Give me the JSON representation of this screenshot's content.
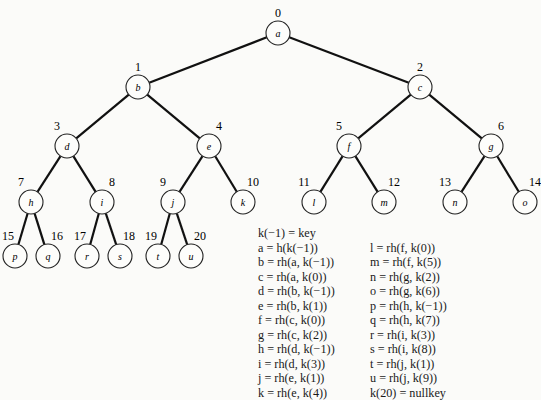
{
  "diagram": {
    "type": "binary-tree",
    "nodes": [
      {
        "id": "a",
        "index": "0",
        "x": 278,
        "y": 33
      },
      {
        "id": "b",
        "index": "1",
        "x": 138,
        "y": 87
      },
      {
        "id": "c",
        "index": "2",
        "x": 420,
        "y": 87
      },
      {
        "id": "d",
        "index": "3",
        "x": 67,
        "y": 146
      },
      {
        "id": "e",
        "index": "4",
        "x": 209,
        "y": 146
      },
      {
        "id": "f",
        "index": "5",
        "x": 349,
        "y": 146
      },
      {
        "id": "g",
        "index": "6",
        "x": 491,
        "y": 146
      },
      {
        "id": "h",
        "index": "7",
        "x": 31,
        "y": 202
      },
      {
        "id": "i",
        "index": "8",
        "x": 102,
        "y": 202
      },
      {
        "id": "j",
        "index": "9",
        "x": 173,
        "y": 202
      },
      {
        "id": "k",
        "index": "10",
        "x": 243,
        "y": 202
      },
      {
        "id": "l",
        "index": "11",
        "x": 314,
        "y": 202
      },
      {
        "id": "m",
        "index": "12",
        "x": 384,
        "y": 202
      },
      {
        "id": "n",
        "index": "13",
        "x": 455,
        "y": 202
      },
      {
        "id": "o",
        "index": "14",
        "x": 525,
        "y": 202
      },
      {
        "id": "p",
        "index": "15",
        "x": 15,
        "y": 256
      },
      {
        "id": "q",
        "index": "16",
        "x": 48,
        "y": 256
      },
      {
        "id": "r",
        "index": "17",
        "x": 87,
        "y": 256
      },
      {
        "id": "s",
        "index": "18",
        "x": 120,
        "y": 256
      },
      {
        "id": "t",
        "index": "19",
        "x": 158,
        "y": 256
      },
      {
        "id": "u",
        "index": "20",
        "x": 191,
        "y": 256
      }
    ],
    "edges": [
      [
        "a",
        "b"
      ],
      [
        "a",
        "c"
      ],
      [
        "b",
        "d"
      ],
      [
        "b",
        "e"
      ],
      [
        "c",
        "f"
      ],
      [
        "c",
        "g"
      ],
      [
        "d",
        "h"
      ],
      [
        "d",
        "i"
      ],
      [
        "e",
        "j"
      ],
      [
        "e",
        "k"
      ],
      [
        "f",
        "l"
      ],
      [
        "f",
        "m"
      ],
      [
        "g",
        "n"
      ],
      [
        "g",
        "o"
      ],
      [
        "h",
        "p"
      ],
      [
        "h",
        "q"
      ],
      [
        "i",
        "r"
      ],
      [
        "i",
        "s"
      ],
      [
        "j",
        "t"
      ],
      [
        "j",
        "u"
      ]
    ]
  },
  "legend": {
    "header": "k(−1) = key",
    "left": [
      "a  =  h(k(−1))",
      "b  =  rh(a, k(−1))",
      "c  =  rh(a, k(0))",
      "d  =  rh(b, k(−1))",
      "e  =  rh(b, k(1))",
      "f  =  rh(c, k(0))",
      "g  =  rh(c, k(2))",
      "h  =  rh(d, k(−1))",
      "i  =  rh(d, k(3))",
      "j  =  rh(e, k(1))",
      "k  =  rh(e, k(4))"
    ],
    "right": [
      "l  =  rh(f, k(0))",
      "m  =  rh(f, k(5))",
      "n  =  rh(g, k(2))",
      "o  =  rh(g, k(6))",
      "p  =  rh(h, k(−1))",
      "q  =  rh(h, k(7))",
      "r  =  rh(i, k(3))",
      "s  =  rh(i, k(8))",
      "t  =  rh(j, k(1))",
      "u  =  rh(j, k(9))",
      "k(20)  =  nullkey"
    ]
  }
}
